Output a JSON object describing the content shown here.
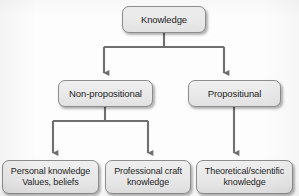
{
  "diagram": {
    "type": "hierarchy-tree",
    "orientation": "top-down",
    "levels": 3,
    "colors": {
      "node_fill": "#e9e9e9",
      "node_border": "#8d8d8d",
      "connector": "#6f6f6f",
      "text": "#1d1d1d",
      "background": "#fdfdfd"
    },
    "nodes": {
      "root": {
        "id": "knowledge",
        "label": "Knowledge"
      },
      "level2": [
        {
          "id": "non-propositional",
          "label": "Non-propositional"
        },
        {
          "id": "propositional",
          "label": "Propositiunal"
        }
      ],
      "level3": [
        {
          "id": "personal-knowledge",
          "label": "Personal knowledge\nValues, beliefs"
        },
        {
          "id": "professional-craft",
          "label": "Professional craft\nknowledge"
        },
        {
          "id": "theoretical-scientific",
          "label": "Theoretical/scientific\nknowledge"
        }
      ]
    },
    "edges": [
      {
        "from": "knowledge",
        "to": "non-propositional",
        "style": "elbow-arrow"
      },
      {
        "from": "knowledge",
        "to": "propositional",
        "style": "elbow-arrow"
      },
      {
        "from": "non-propositional",
        "to": "personal-knowledge",
        "style": "elbow-arrow"
      },
      {
        "from": "non-propositional",
        "to": "professional-craft",
        "style": "elbow-arrow"
      },
      {
        "from": "propositional",
        "to": "theoretical-scientific",
        "style": "straight-arrow"
      }
    ]
  }
}
